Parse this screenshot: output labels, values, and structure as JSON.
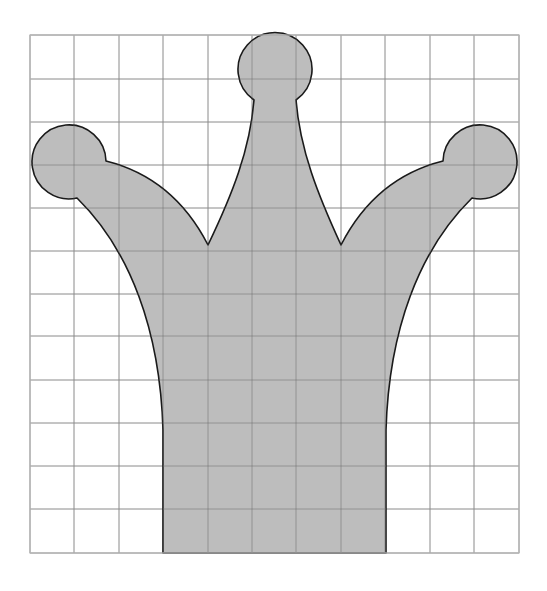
{
  "diagram": {
    "title": "",
    "grid": {
      "columns": 11,
      "rows": 12,
      "x_lines": [
        30,
        74,
        119,
        163,
        208,
        252,
        296,
        341,
        385,
        430,
        474,
        519
      ],
      "y_lines": [
        35,
        79,
        122,
        165,
        208,
        251,
        294,
        336,
        380,
        423,
        466,
        509,
        553
      ],
      "line_color": "#8a8a8a"
    },
    "shape": {
      "name": "crown",
      "fill_color": "#bdbdbd",
      "stroke_color": "#1a1a1a",
      "path": "M 163 553 L 163 430 C 160 330 130 250 77 198 A 37 37 0 1 1 106 161 C 150 172 185 200 208 245 C 232 195 250 150 254 100 A 37 37 0 1 1 296 100 C 300 150 318 195 341 245 C 364 200 399 172 443 161 A 37 37 0 1 1 472 198 C 419 250 389 330 386 430 L 386 553 Z",
      "features": [
        {
          "name": "left-ball",
          "cx": 74,
          "cy": 163,
          "r": 37
        },
        {
          "name": "top-ball",
          "cx": 275,
          "cy": 72,
          "r": 37
        },
        {
          "name": "right-ball",
          "cx": 475,
          "cy": 163,
          "r": 37
        },
        {
          "name": "left-valley",
          "x": 208,
          "y": 245
        },
        {
          "name": "right-valley",
          "x": 341,
          "y": 245
        },
        {
          "name": "base-left",
          "x": 163,
          "y": 553
        },
        {
          "name": "base-right",
          "x": 386,
          "y": 553
        }
      ]
    }
  }
}
